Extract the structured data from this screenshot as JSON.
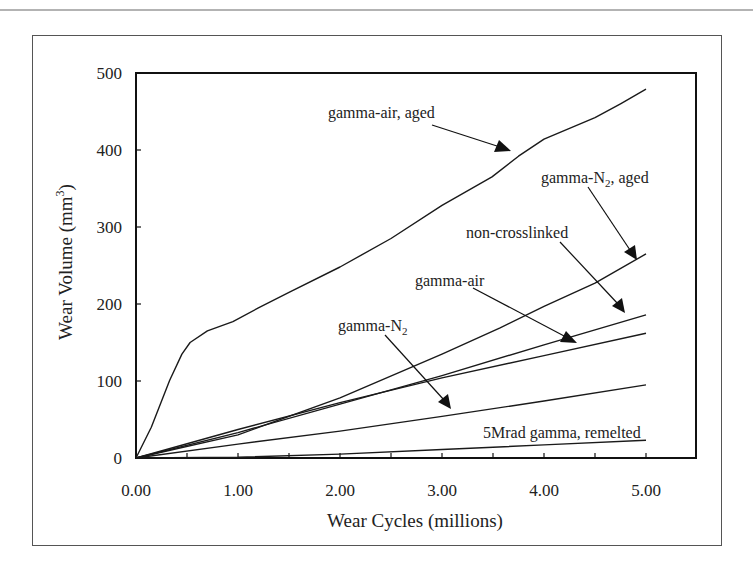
{
  "chart_data": {
    "type": "line",
    "title": "",
    "xlabel": "Wear Cycles (millions)",
    "ylabel": "Wear Volume (mm",
    "ylabel_sup": "3",
    "ylabel_close": ")",
    "xlim": [
      0,
      5.5
    ],
    "ylim": [
      0,
      500
    ],
    "grid": false,
    "legend": "none (inline annotations with arrows)",
    "x_ticks": [
      0,
      1,
      2,
      3,
      4,
      5
    ],
    "x_tick_labels": [
      "0.00",
      "1.00",
      "2.00",
      "3.00",
      "4.00",
      "5.00"
    ],
    "x_minor_ticks": [
      0.5,
      1.5,
      2.5,
      3.5,
      4.5
    ],
    "y_ticks": [
      0,
      100,
      200,
      300,
      400,
      500
    ],
    "y_tick_labels": [
      "0",
      "100",
      "200",
      "300",
      "400",
      "500"
    ],
    "series": [
      {
        "name": "gamma-air, aged",
        "x": [
          0,
          0.15,
          0.33,
          0.45,
          0.53,
          0.7,
          0.95,
          1.2,
          1.5,
          2.0,
          2.5,
          3.0,
          3.49,
          3.75,
          4.0,
          4.25,
          4.5,
          4.75,
          5.0
        ],
        "values": [
          0,
          40,
          101,
          135,
          150,
          165,
          177,
          195,
          215,
          248,
          285,
          328,
          365,
          392,
          414,
          428,
          442,
          460,
          479
        ]
      },
      {
        "name": "gamma-N2, aged",
        "x": [
          0,
          1.0,
          2.0,
          3.0,
          3.57,
          4.0,
          4.5,
          5.0
        ],
        "values": [
          0,
          30,
          78,
          135,
          169,
          197,
          227,
          265
        ]
      },
      {
        "name": "non-crosslinked",
        "x": [
          0,
          1.0,
          2.0,
          3.0,
          4.0,
          5.0
        ],
        "values": [
          0,
          33,
          70,
          107,
          147,
          186
        ]
      },
      {
        "name": "gamma-air",
        "x": [
          0,
          1.0,
          2.0,
          3.0,
          4.0,
          5.0
        ],
        "values": [
          0,
          37,
          72,
          104,
          133,
          162
        ]
      },
      {
        "name": "gamma-N2",
        "x": [
          0,
          1.0,
          2.0,
          3.0,
          4.0,
          5.0
        ],
        "values": [
          0,
          18,
          35,
          54,
          74,
          95
        ]
      },
      {
        "name": "5Mrad gamma, remelted",
        "x": [
          0,
          1.0,
          2.0,
          3.0,
          4.0,
          5.0
        ],
        "values": [
          0,
          1,
          5,
          11,
          17,
          23
        ]
      }
    ],
    "annotations": [
      {
        "text": "gamma-air, aged",
        "target_series": "gamma-air, aged"
      },
      {
        "text": "gamma-N",
        "sub": "2",
        "suffix": ", aged",
        "target_series": "gamma-N2, aged"
      },
      {
        "text": "non-crosslinked",
        "target_series": "non-crosslinked"
      },
      {
        "text": "gamma-air",
        "target_series": "gamma-air"
      },
      {
        "text": "gamma-N",
        "sub": "2",
        "suffix": "",
        "target_series": "gamma-N2"
      },
      {
        "text": "5Mrad gamma, remelted",
        "target_series": "5Mrad gamma, remelted"
      }
    ]
  }
}
